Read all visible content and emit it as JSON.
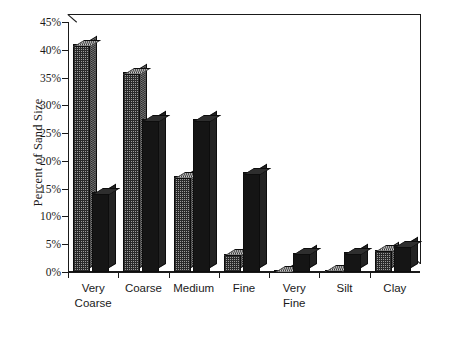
{
  "chart_data": {
    "type": "bar",
    "title": "",
    "subtitle": "",
    "xlabel": "",
    "ylabel": "Percent of Sand Size",
    "ylim": [
      0,
      45
    ],
    "y_tick_labels": [
      "0%",
      "5%",
      "10%",
      "15%",
      "20%",
      "25%",
      "30%",
      "35%",
      "40%",
      "45%"
    ],
    "y_tick_values": [
      0,
      5,
      10,
      15,
      20,
      25,
      30,
      35,
      40,
      45
    ],
    "grid": false,
    "legend_position": "none",
    "categories": [
      "Very Coarse",
      "Coarse",
      "Medium",
      "Fine",
      "Very Fine",
      "Silt",
      "Clay"
    ],
    "category_lines": [
      [
        "Very",
        "Coarse"
      ],
      [
        "Coarse",
        ""
      ],
      [
        "Medium",
        ""
      ],
      [
        "Fine",
        ""
      ],
      [
        "Very",
        "Fine"
      ],
      [
        "Silt",
        ""
      ],
      [
        "Clay",
        ""
      ]
    ],
    "series": [
      {
        "name": "Series 1",
        "pattern": "checkered",
        "color": "#9c9c9c",
        "values": [
          41.0,
          36.0,
          17.3,
          3.3,
          0.3,
          0.4,
          4.0
        ]
      },
      {
        "name": "Series 2",
        "pattern": "solid",
        "color": "#151515",
        "values": [
          14.4,
          27.5,
          27.5,
          18.0,
          3.5,
          3.6,
          4.8
        ]
      }
    ]
  },
  "colors": {
    "axis": "#1a1a1a",
    "background": "#ffffff",
    "series_a": "#9c9c9c",
    "series_b": "#151515"
  }
}
